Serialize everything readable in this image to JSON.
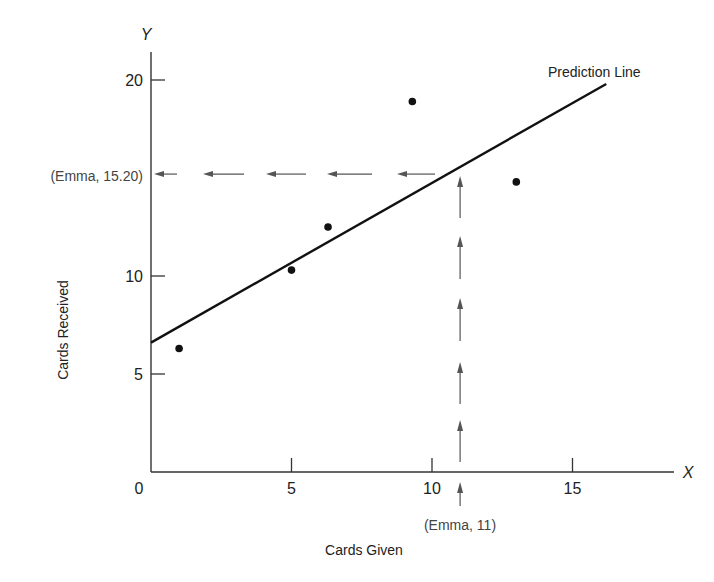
{
  "chart_data": {
    "type": "scatter",
    "title": "",
    "xlabel": "Cards Given",
    "ylabel": "Cards Received",
    "x_axis_letter": "X",
    "y_axis_letter": "Y",
    "origin_label": "0",
    "xlim": [
      0,
      18.5
    ],
    "ylim": [
      0,
      22
    ],
    "x_ticks": [
      5,
      10,
      15
    ],
    "x_tick_labels": [
      "5",
      "10",
      "15"
    ],
    "y_ticks": [
      5,
      10,
      20
    ],
    "y_tick_labels": [
      "5",
      "10",
      "20"
    ],
    "grid": false,
    "series": [
      {
        "name": "Observed",
        "points": [
          {
            "x": 1.0,
            "y": 6.3
          },
          {
            "x": 5.0,
            "y": 10.3
          },
          {
            "x": 6.3,
            "y": 12.5
          },
          {
            "x": 9.3,
            "y": 18.9
          },
          {
            "x": 13.0,
            "y": 14.8
          }
        ]
      }
    ],
    "prediction_line": {
      "label": "Prediction Line",
      "start": {
        "x": 0,
        "y": 6.6
      },
      "end": {
        "x": 16.2,
        "y": 19.8
      }
    },
    "annotations": {
      "x_marker": {
        "label": "(Emma, 11)",
        "x": 11
      },
      "y_marker": {
        "label": "(Emma, 15.20)",
        "y": 15.2
      }
    }
  }
}
